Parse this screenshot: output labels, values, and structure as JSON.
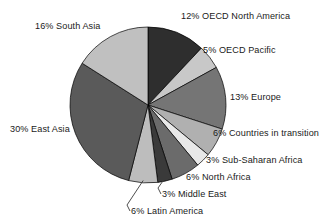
{
  "chart_data": {
    "type": "pie",
    "title": "",
    "subtitle": "",
    "xlabel": "",
    "ylabel": "",
    "legend_position": "none",
    "grid": false,
    "units": "percent",
    "total": 100,
    "start_angle_deg": 0,
    "direction": "clockwise",
    "categories": [
      "OECD North America",
      "OECD Pacific",
      "Europe",
      "Countries in transition",
      "Sub-Saharan Africa",
      "North Africa",
      "Middle East",
      "Latin America",
      "East Asia",
      "South Asia"
    ],
    "values": [
      12,
      5,
      13,
      6,
      3,
      6,
      3,
      6,
      30,
      16
    ],
    "labels": [
      "12% OECD North America",
      "5% OECD Pacific",
      "13% Europe",
      "6% Countries in transition",
      "3% Sub-Saharan Africa",
      "6% North Africa",
      "3% Middle East",
      "6% Latin America",
      "30% East Asia",
      "16% South Asia"
    ],
    "colors": [
      "#2e2e2e",
      "#c8c8c8",
      "#757575",
      "#b0b0b0",
      "#e8e8e8",
      "#6b6b6b",
      "#3a3a3a",
      "#bdbdbd",
      "#5a5a5a",
      "#c0c0c0"
    ],
    "slice_outline_color": "#000000",
    "background_color": "#ffffff",
    "text_color": "#1a1a1a",
    "leader_line_color": "#3a3a3a",
    "slices": [
      {
        "label": "12% OECD North America",
        "category": "OECD North America",
        "value": 12,
        "color": "#2e2e2e",
        "leader_line": false
      },
      {
        "label": "5% OECD Pacific",
        "category": "OECD Pacific",
        "value": 5,
        "color": "#c8c8c8",
        "leader_line": false
      },
      {
        "label": "13% Europe",
        "category": "Europe",
        "value": 13,
        "color": "#757575",
        "leader_line": false
      },
      {
        "label": "6% Countries in transition",
        "category": "Countries in transition",
        "value": 6,
        "color": "#b0b0b0",
        "leader_line": false
      },
      {
        "label": "3% Sub-Saharan Africa",
        "category": "Sub-Saharan Africa",
        "value": 3,
        "color": "#e8e8e8",
        "leader_line": false
      },
      {
        "label": "6% North Africa",
        "category": "North Africa",
        "value": 6,
        "color": "#6b6b6b",
        "leader_line": false
      },
      {
        "label": "3% Middle East",
        "category": "Middle East",
        "value": 3,
        "color": "#3a3a3a",
        "leader_line": true
      },
      {
        "label": "6% Latin America",
        "category": "Latin America",
        "value": 6,
        "color": "#bdbdbd",
        "leader_line": true
      },
      {
        "label": "30% East Asia",
        "category": "East Asia",
        "value": 30,
        "color": "#5a5a5a",
        "leader_line": false
      },
      {
        "label": "16% South Asia",
        "category": "South Asia",
        "value": 16,
        "color": "#c0c0c0",
        "leader_line": false
      }
    ]
  },
  "geometry": {
    "center_x": 148,
    "center_y": 105,
    "radius": 78
  }
}
